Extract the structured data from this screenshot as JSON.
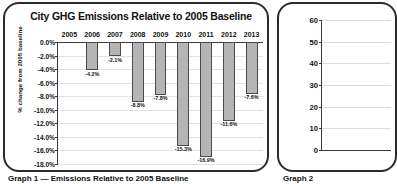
{
  "chart_data": [
    {
      "type": "bar",
      "title": "City GHG Emissions Relative to 2005 Baseline",
      "xlabel": "",
      "ylabel": "% change from 2005 baseline",
      "categories": [
        "2005",
        "2006",
        "2007",
        "2008",
        "2009",
        "2010",
        "2011",
        "2012",
        "2013"
      ],
      "values": [
        0.0,
        -4.2,
        -2.1,
        -8.8,
        -7.8,
        -15.3,
        -16.9,
        -11.6,
        -7.6
      ],
      "data_labels": [
        "",
        "-4.2%",
        "-2.1%",
        "-8.8%",
        "-7.8%",
        "-15.3%",
        "-16.9%",
        "-11.6%",
        "-7.6%"
      ],
      "ylim": [
        -18.0,
        0.0
      ],
      "ytick_labels": [
        "0.0%",
        "-2.0%",
        "-4.0%",
        "-6.0%",
        "-8.0%",
        "-10.0%",
        "-12.0%",
        "-14.0%",
        "-16.0%",
        "-18.0%"
      ],
      "ytick_values": [
        0.0,
        -2.0,
        -4.0,
        -6.0,
        -8.0,
        -10.0,
        -12.0,
        -14.0,
        -16.0,
        -18.0
      ],
      "grid": true,
      "legend": "none",
      "bar_color": "#b5b5b5",
      "bar_border_color": "#4a4a4a",
      "caption": "Graph 1 — Emissions Relative to 2005 Baseline"
    },
    {
      "type": "bar",
      "title": "",
      "xlabel": "",
      "ylabel": "",
      "categories": [],
      "values": [],
      "ylim": [
        0,
        60
      ],
      "ytick_labels": [
        "60",
        "50",
        "40",
        "30",
        "20",
        "10",
        "0"
      ],
      "ytick_values": [
        60,
        50,
        40,
        30,
        20,
        10,
        0
      ],
      "grid": true,
      "legend": "none",
      "caption": "Graph 2",
      "note": "partially visible, clipped at right edge of screenshot"
    }
  ],
  "panels": {
    "graph1": {
      "title": "City GHG Emissions Relative to 2005 Baseline",
      "ylabel": "% change from 2005 baseline",
      "caption": "Graph 1 — Emissions Relative to 2005 Baseline"
    },
    "graph2": {
      "caption": "Graph 2"
    }
  }
}
